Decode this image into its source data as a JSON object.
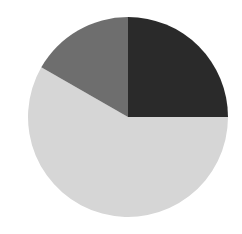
{
  "chart_data": {
    "type": "pie",
    "title": "",
    "start_angle_deg": 0,
    "direction": "clockwise",
    "center": [
      128,
      117
    ],
    "radius": 100,
    "slices": [
      {
        "label": "",
        "value": 25.0,
        "color": "#2a2a2a"
      },
      {
        "label": "",
        "value": 58.3,
        "color": "#d6d6d6"
      },
      {
        "label": "",
        "value": 16.7,
        "color": "#6e6e6e"
      }
    ],
    "legend": [],
    "background": "#ffffff"
  }
}
